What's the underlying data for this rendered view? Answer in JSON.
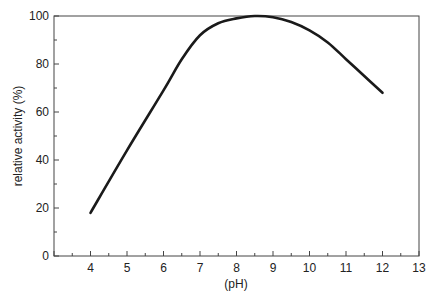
{
  "chart_data": {
    "type": "line",
    "title": "",
    "xlabel": "(pH)",
    "ylabel": "relative activity (%)",
    "xlim": [
      3,
      13
    ],
    "ylim": [
      0,
      100
    ],
    "x_ticks": [
      4,
      5,
      6,
      7,
      8,
      9,
      10,
      11,
      12,
      13
    ],
    "y_ticks": [
      0,
      20,
      40,
      60,
      80,
      100
    ],
    "grid": false,
    "legend": null,
    "series": [
      {
        "name": "relative activity",
        "color": "#1a1a1a",
        "x": [
          4,
          5,
          6,
          6.5,
          7,
          7.5,
          8,
          8.5,
          9,
          9.5,
          10,
          10.5,
          11,
          11.5,
          12
        ],
        "values": [
          18,
          44,
          69,
          82,
          92,
          97,
          99,
          100,
          99.5,
          97.5,
          94,
          89,
          82,
          75,
          68
        ]
      }
    ]
  }
}
